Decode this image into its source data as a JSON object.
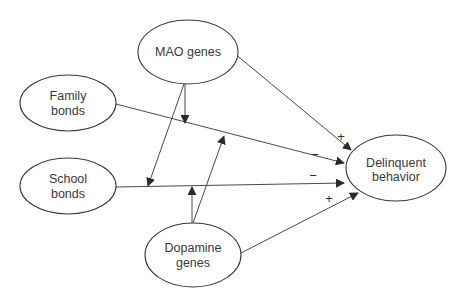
{
  "diagram": {
    "type": "path-model",
    "nodes": {
      "mao": {
        "line1": "MAO genes",
        "line2": ""
      },
      "family": {
        "line1": "Family",
        "line2": "bonds"
      },
      "school": {
        "line1": "School",
        "line2": "bonds"
      },
      "dopamine": {
        "line1": "Dopamine",
        "line2": "genes"
      },
      "delinquent": {
        "line1": "Delinquent",
        "line2": "behavior"
      }
    },
    "edges": [
      {
        "from": "MAO genes",
        "to": "Delinquent behavior",
        "sign": "+"
      },
      {
        "from": "Family bonds",
        "to": "Delinquent behavior",
        "sign": "−"
      },
      {
        "from": "School bonds",
        "to": "Delinquent behavior",
        "sign": "−"
      },
      {
        "from": "Dopamine genes",
        "to": "Delinquent behavior",
        "sign": "+"
      },
      {
        "from": "MAO genes",
        "to": "Family bonds → Delinquent behavior path",
        "sign": ""
      },
      {
        "from": "MAO genes",
        "to": "School bonds → Delinquent behavior path",
        "sign": ""
      },
      {
        "from": "Dopamine genes",
        "to": "School bonds → Delinquent behavior path",
        "sign": ""
      },
      {
        "from": "Dopamine genes",
        "to": "Family bonds → Delinquent behavior path",
        "sign": ""
      }
    ],
    "signs": {
      "mao_delinquent": "+",
      "family_delinquent": "−",
      "school_delinquent": "−",
      "dopamine_delinquent": "+"
    },
    "colors": {
      "stroke": "#3a3a3a",
      "text": "#3a3a3a",
      "background": "#ffffff"
    }
  }
}
